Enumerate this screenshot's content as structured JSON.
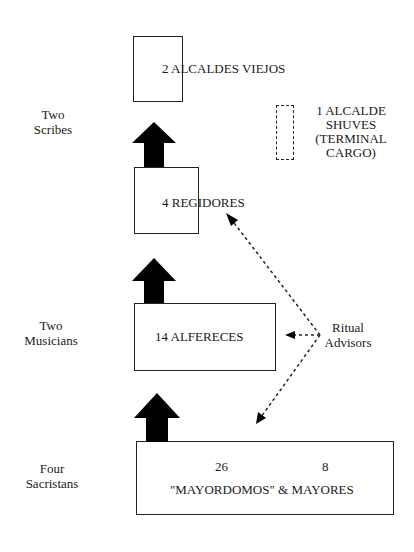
{
  "diagram": {
    "type": "cargo-hierarchy",
    "levels": [
      {
        "id": "alcaldes-viejos",
        "label": "2 ALCALDES VIEJOS",
        "side_label": [
          "Two",
          "Scribes"
        ]
      },
      {
        "id": "regidores",
        "label": "4 REGIDORES",
        "side_label": []
      },
      {
        "id": "alfereces",
        "label": "14 ALFERECES",
        "side_label": [
          "Two",
          "Musicians"
        ]
      },
      {
        "id": "mayordomos",
        "counts": [
          "26",
          "8"
        ],
        "label": "\"MAYORDOMOS\" & MAYORES",
        "side_label": [
          "Four",
          "Sacristans"
        ]
      }
    ],
    "terminal": {
      "lines": [
        "1 ALCALDE",
        "SHUVES",
        "(TERMINAL",
        "CARGO)"
      ]
    },
    "advisors": {
      "lines": [
        "Ritual",
        "Advisors"
      ],
      "points_to": [
        "regidores",
        "alfereces",
        "mayordomos"
      ]
    },
    "colors": {
      "stroke": "#222222",
      "arrow_fill": "#000000",
      "background": "#ffffff"
    }
  }
}
